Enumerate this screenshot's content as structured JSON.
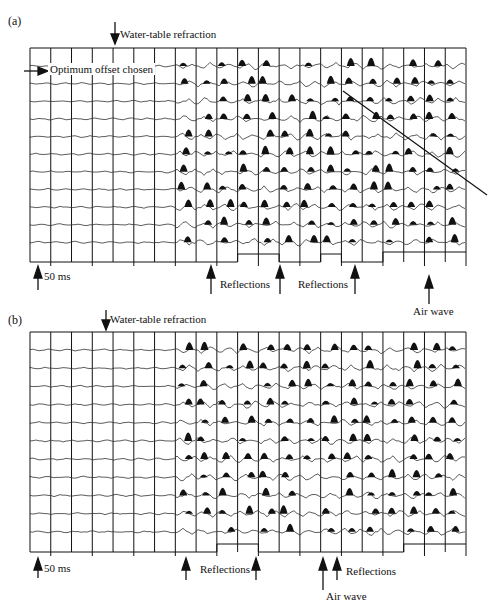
{
  "figure": {
    "panels": [
      {
        "id": "a",
        "label": "(a)",
        "top_annotation": "Water-table refraction",
        "side_annotation": "Optimum offset chosen",
        "scale_label": "50 ms",
        "bottom_annotations": [
          "Reflections",
          "Reflections",
          "Air wave"
        ],
        "trace_count": 11,
        "channel_columns": 21
      },
      {
        "id": "b",
        "label": "(b)",
        "top_annotation": "Water-table refraction",
        "scale_label": "50 ms",
        "bottom_annotations": [
          "Reflections",
          "Reflections",
          "Air wave"
        ],
        "trace_count": 11,
        "channel_columns": 21
      }
    ],
    "colors": {
      "ink": "#111111",
      "paper": "#ffffff",
      "trace": "#333333"
    }
  }
}
